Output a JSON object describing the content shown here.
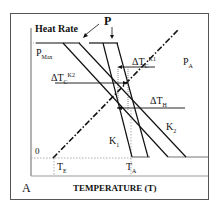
{
  "diagram": {
    "panel_label": "A",
    "y_axis_label": "Heat Rate",
    "x_axis_label": "TEMPERATURE (T)",
    "labels": {
      "p": "P",
      "p_max": "P",
      "p_max_sub": "Max",
      "p_a": "P",
      "p_a_sub": "A",
      "delta_tc_k1": "ΔT",
      "delta_tc_k1_sub": "C",
      "delta_tc_k1_sup": "K1",
      "delta_tc_k2": "ΔT",
      "delta_tc_k2_sub": "C",
      "delta_tc_k2_sup": "K2",
      "delta_th": "ΔT",
      "delta_th_sub": "H",
      "k1": "K",
      "k1_sub": "1",
      "k2": "K",
      "k2_sub": "2",
      "zero": "0",
      "t_e": "T",
      "t_e_sub": "E",
      "t_a": "T",
      "t_a_sub": "A"
    },
    "colors": {
      "line": "#111111",
      "frame": "#555555",
      "dotted": "#888888"
    }
  }
}
